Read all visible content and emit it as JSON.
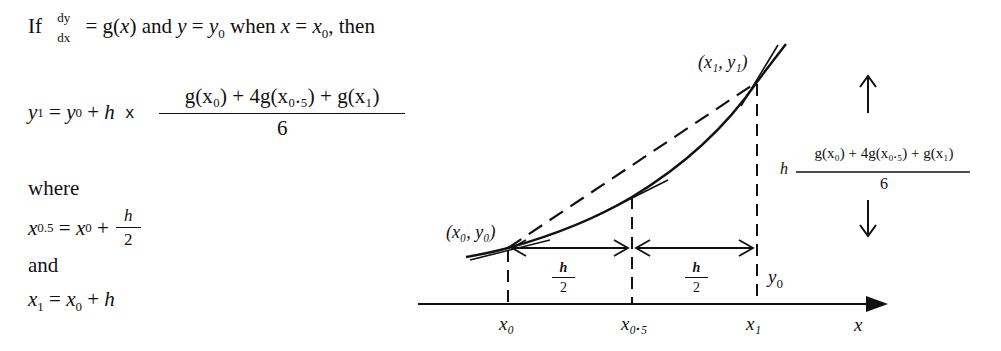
{
  "formula": {
    "line1": {
      "if": "If",
      "deriv_num": "dy",
      "deriv_den": "dx",
      "eq_g": "= g(",
      "x": "x",
      "close_and": ") and ",
      "y": "y",
      "eq": " = ",
      "y0_base": "y",
      "y0_sub": "0",
      "when": " when ",
      "x2": "x",
      "eq2": " = ",
      "x0_base": "x",
      "x0_sub": "0",
      "then": ", then"
    },
    "line2": {
      "y1_base": "y",
      "y1_sub": "1",
      "eq": " = ",
      "y0_base": "y",
      "y0_sub": "0",
      "plus": " + ",
      "h": "h",
      "times": " x ",
      "numerator": "g(x₀) + 4g(x₀.₅) + g(x₁)",
      "denominator": "6"
    },
    "where": "where",
    "line3": {
      "x05_base": "x",
      "x05_sub": "0.5",
      "eq": " = ",
      "x0_base": "x",
      "x0_sub": "0",
      "plus": " + ",
      "frac_num": "h",
      "frac_den": "2"
    },
    "and": "and",
    "line4": {
      "x1_base": "x",
      "x1_sub": "1",
      "eq": " = ",
      "x0_base": "x",
      "x0_sub": "0",
      "plus": " + ",
      "h": "h"
    }
  },
  "diagram": {
    "point_start": "(x₀, y₀)",
    "point_end": "(x₁, y₁)",
    "interval_label_num": "h",
    "interval_label_den": "2",
    "axis_labels": [
      "x₀",
      "x₀.₅",
      "x₁"
    ],
    "axis_name": "x",
    "y0_label_base": "y",
    "y0_label_sub": "0",
    "increment_h": "h",
    "increment_numerator": "g(x₀) + 4g(x₀.₅) + g(x₁)",
    "increment_denominator": "6"
  }
}
